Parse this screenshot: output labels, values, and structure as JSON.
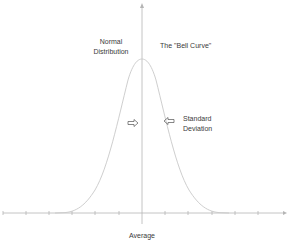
{
  "diagram": {
    "labels": {
      "normal_distribution_line1": "Normal",
      "normal_distribution_line2": "Distribution",
      "bell_curve": "The \"Bell Curve\"",
      "standard_deviation_line1": "Standard",
      "standard_deviation_line2": "Deviation",
      "average": "Average"
    },
    "colors": {
      "axis": "#b5b5b5",
      "curve": "#c8c8c8",
      "text": "#3a3a3a",
      "arrow": "#555555"
    },
    "axis": {
      "tick_count_each_side": 6
    }
  }
}
